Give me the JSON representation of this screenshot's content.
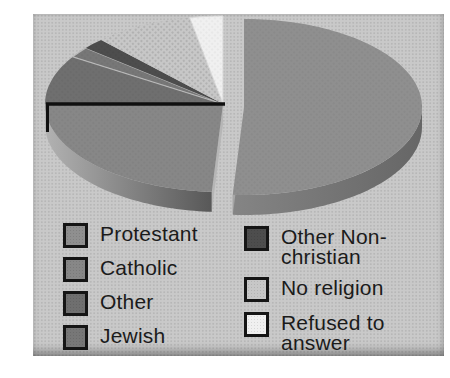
{
  "figure": {
    "page_background": "#ffffff",
    "panel_background": "#c9c9c9",
    "text_color": "#1b1b1b",
    "swatch_border_color": "#151515"
  },
  "chart_data": {
    "type": "pie",
    "style": "3d-exploded-grayscale",
    "title": "",
    "values_are_estimates": true,
    "slices": [
      {
        "label": "Protestant",
        "value_pct": 51,
        "color": "#8f8f8f",
        "exploded": true
      },
      {
        "label": "Catholic",
        "value_pct": 24,
        "color": "#878787"
      },
      {
        "label": "Other",
        "value_pct": 9,
        "color": "#6f6f6f"
      },
      {
        "label": "Jewish",
        "value_pct": 2,
        "color": "#777777",
        "stroke": "#b9b9b9"
      },
      {
        "label": "Other Non-christian",
        "value_pct": 2,
        "color": "#4d4d4d"
      },
      {
        "label": "No religion",
        "value_pct": 9,
        "color": "#c7c7c7",
        "texture": "halftone-dots"
      },
      {
        "label": "Refused to answer",
        "value_pct": 3,
        "color": "#f0f0f0",
        "stroke": "#d9d9d9"
      }
    ],
    "legend": {
      "position": "bottom",
      "columns": 2,
      "column1_indices": [
        0,
        1,
        2,
        3
      ],
      "column2_indices": [
        4,
        5,
        6
      ]
    },
    "colors": {
      "protestant_side": [
        "#8a8a8a",
        "#666666"
      ],
      "catholic_side": [
        "#b2b2b2",
        "#565656"
      ],
      "protestant_cut_wall": [
        "#dedede",
        "#9a9a9a"
      ],
      "catholic_cut_wall": "#b6b6b6",
      "boundary_line": "#101010",
      "halftone_overlay_dot": "rgba(0,0,0,0.08)",
      "no_religion_dot": "#a9a9a9"
    }
  }
}
